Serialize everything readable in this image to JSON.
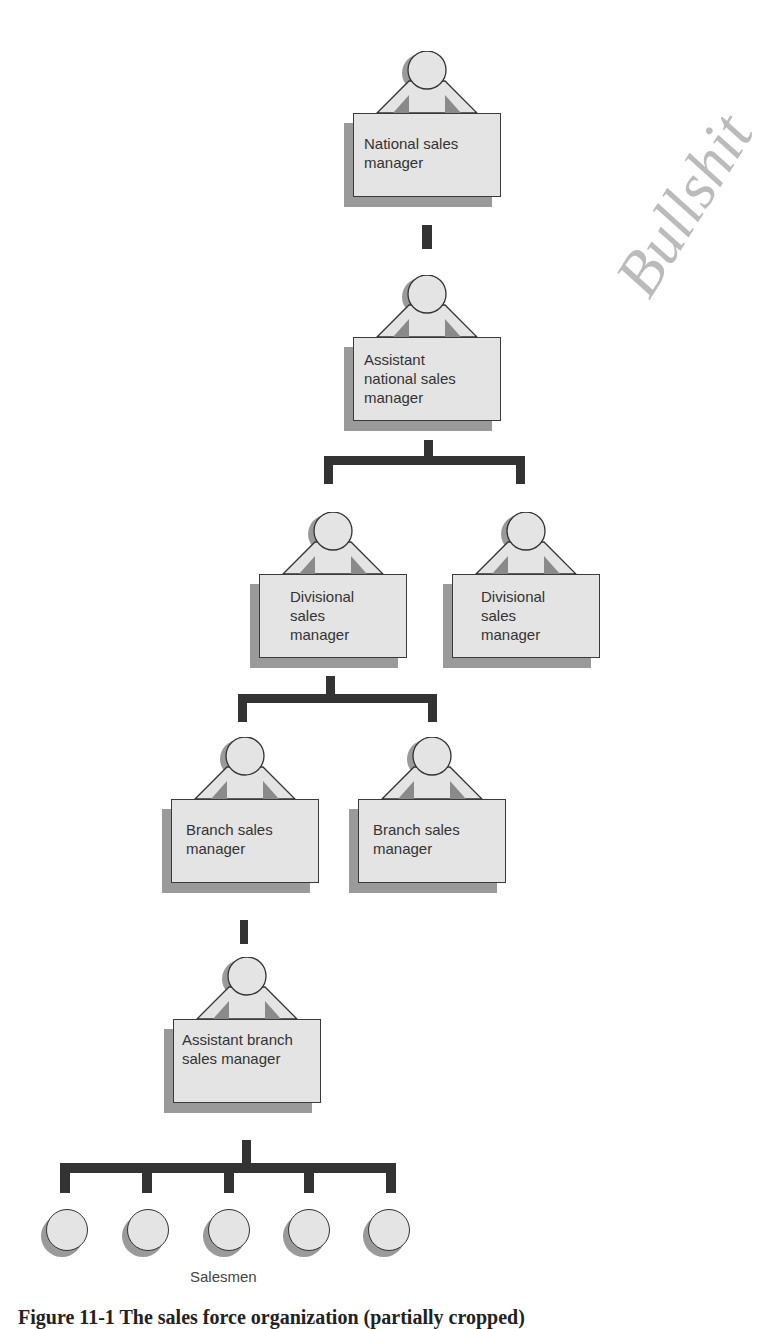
{
  "figure": {
    "nodes": [
      {
        "id": "national",
        "label": "National sales manager"
      },
      {
        "id": "asst_national",
        "label": "Assistant national sales manager"
      },
      {
        "id": "div_left",
        "label": "Divisional sales manager"
      },
      {
        "id": "div_right",
        "label": "Divisional sales manager"
      },
      {
        "id": "branch_left",
        "label": "Branch sales manager"
      },
      {
        "id": "branch_right",
        "label": "Branch sales manager"
      },
      {
        "id": "asst_branch",
        "label": "Assistant branch sales manager"
      }
    ],
    "salesmen_label": "Salesmen",
    "salesmen_count": 5,
    "caption": "Figure 11-1  The sales force organization (partially cropped)",
    "handwritten_note": "Bullshit"
  },
  "colors": {
    "box_fill": "#e4e4e4",
    "shadow": "#9a9a9a",
    "line": "#333333",
    "arm_shade": "#8a8a8a"
  }
}
